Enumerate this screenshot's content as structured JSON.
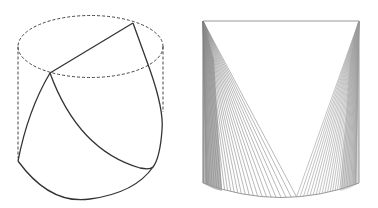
{
  "figures": [
    {
      "name": "cylinder-with-cut-surface",
      "description": "Wireframe cylinder with dashed top ellipse and edges; solid curves show a slanted cut surface",
      "stroke_color": "#333333",
      "dashed_color": "#444444"
    },
    {
      "name": "cylinder-with-ruled-fans",
      "description": "Cylinder shaded by two fans of ruled lines from the top corners to the bottom rim",
      "stroke_color": "#888888",
      "fan_line_count": 28
    }
  ]
}
